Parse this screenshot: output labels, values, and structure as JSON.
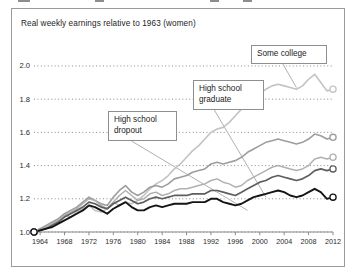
{
  "figure": {
    "title": "Real weekly earnings relative to 1963 (women)"
  },
  "chart_data": {
    "type": "line",
    "title": "Real weekly earnings relative to 1963 (women)",
    "xlabel": "",
    "ylabel": "",
    "xlim": [
      1963,
      2012
    ],
    "ylim": [
      1.0,
      2.06
    ],
    "grid": "horizontal-dotted",
    "legend": "annotated-callouts",
    "y_ticks": [
      "1.0",
      "1.2",
      "1.4",
      "1.6",
      "1.8",
      "2.0"
    ],
    "y_tick_values": [
      1.0,
      1.2,
      1.4,
      1.6,
      1.8,
      2.0
    ],
    "x_ticks": [
      "1964",
      "1968",
      "1972",
      "1976",
      "1980",
      "1984",
      "1988",
      "1992",
      "1996",
      "2000",
      "2004",
      "2008",
      "2012"
    ],
    "x_tick_values": [
      1964,
      1968,
      1972,
      1976,
      1980,
      1984,
      1988,
      1992,
      1996,
      2000,
      2004,
      2008,
      2012
    ],
    "x": [
      1963,
      1964,
      1965,
      1966,
      1967,
      1968,
      1969,
      1970,
      1971,
      1972,
      1973,
      1974,
      1975,
      1976,
      1977,
      1978,
      1979,
      1980,
      1981,
      1982,
      1983,
      1984,
      1985,
      1986,
      1987,
      1988,
      1989,
      1990,
      1991,
      1992,
      1993,
      1994,
      1995,
      1996,
      1997,
      1998,
      1999,
      2000,
      2001,
      2002,
      2003,
      2004,
      2005,
      2006,
      2007,
      2008,
      2009,
      2010,
      2011,
      2012
    ],
    "series": [
      {
        "name": "Bachelor's degree or higher",
        "color": "#c3c3c3",
        "width": 1.6,
        "marker_start": "open-circle",
        "marker_end": "open-circle",
        "values": [
          1.0,
          1.02,
          1.03,
          1.05,
          1.07,
          1.1,
          1.09,
          1.12,
          1.14,
          1.16,
          1.13,
          1.12,
          1.14,
          1.18,
          1.16,
          1.18,
          1.17,
          1.19,
          1.22,
          1.26,
          1.29,
          1.31,
          1.34,
          1.38,
          1.41,
          1.45,
          1.49,
          1.52,
          1.56,
          1.6,
          1.62,
          1.63,
          1.66,
          1.7,
          1.74,
          1.77,
          1.8,
          1.83,
          1.86,
          1.88,
          1.89,
          1.88,
          1.87,
          1.86,
          1.88,
          1.92,
          1.95,
          1.9,
          1.85,
          1.86
        ]
      },
      {
        "name": "Some college",
        "color": "#9d9d9d",
        "width": 1.6,
        "marker_start": "open-circle",
        "marker_end": "open-circle",
        "values": [
          1.0,
          1.02,
          1.04,
          1.06,
          1.08,
          1.11,
          1.13,
          1.15,
          1.18,
          1.21,
          1.19,
          1.17,
          1.16,
          1.21,
          1.25,
          1.28,
          1.24,
          1.22,
          1.24,
          1.27,
          1.28,
          1.27,
          1.29,
          1.32,
          1.33,
          1.34,
          1.36,
          1.37,
          1.38,
          1.41,
          1.42,
          1.41,
          1.42,
          1.43,
          1.45,
          1.48,
          1.5,
          1.52,
          1.54,
          1.55,
          1.56,
          1.55,
          1.54,
          1.53,
          1.54,
          1.56,
          1.59,
          1.58,
          1.56,
          1.57
        ]
      },
      {
        "name": "High school graduate",
        "color": "#b0b0b0",
        "width": 1.5,
        "marker_start": "open-circle",
        "marker_end": "open-circle",
        "values": [
          1.0,
          1.01,
          1.03,
          1.05,
          1.07,
          1.1,
          1.12,
          1.14,
          1.17,
          1.2,
          1.19,
          1.16,
          1.14,
          1.18,
          1.22,
          1.25,
          1.22,
          1.19,
          1.2,
          1.23,
          1.24,
          1.22,
          1.23,
          1.25,
          1.26,
          1.26,
          1.27,
          1.28,
          1.29,
          1.31,
          1.32,
          1.3,
          1.29,
          1.27,
          1.28,
          1.31,
          1.33,
          1.35,
          1.37,
          1.39,
          1.4,
          1.39,
          1.38,
          1.37,
          1.38,
          1.4,
          1.44,
          1.45,
          1.44,
          1.45
        ]
      },
      {
        "name": "High school dropout",
        "color": "#5e5e5e",
        "width": 1.7,
        "marker_start": "open-circle",
        "marker_end": "open-circle",
        "values": [
          1.0,
          1.01,
          1.02,
          1.04,
          1.06,
          1.09,
          1.11,
          1.13,
          1.15,
          1.18,
          1.17,
          1.15,
          1.14,
          1.17,
          1.19,
          1.21,
          1.19,
          1.17,
          1.18,
          1.2,
          1.21,
          1.2,
          1.21,
          1.22,
          1.22,
          1.22,
          1.23,
          1.23,
          1.23,
          1.25,
          1.25,
          1.24,
          1.23,
          1.22,
          1.24,
          1.26,
          1.28,
          1.3,
          1.31,
          1.33,
          1.34,
          1.33,
          1.32,
          1.31,
          1.32,
          1.34,
          1.37,
          1.38,
          1.37,
          1.38
        ]
      },
      {
        "name": "All women",
        "color": "#141414",
        "width": 1.9,
        "marker_start": "open-circle",
        "marker_end": "open-circle",
        "values": [
          1.0,
          1.01,
          1.02,
          1.03,
          1.05,
          1.07,
          1.09,
          1.11,
          1.13,
          1.16,
          1.15,
          1.13,
          1.11,
          1.14,
          1.16,
          1.18,
          1.15,
          1.13,
          1.13,
          1.15,
          1.16,
          1.15,
          1.16,
          1.17,
          1.17,
          1.17,
          1.18,
          1.18,
          1.18,
          1.2,
          1.2,
          1.18,
          1.17,
          1.16,
          1.17,
          1.19,
          1.21,
          1.22,
          1.23,
          1.24,
          1.25,
          1.24,
          1.22,
          1.21,
          1.22,
          1.24,
          1.26,
          1.24,
          1.2,
          1.21
        ]
      }
    ],
    "annotations": [
      {
        "label": "Some college",
        "target_x": 2006,
        "target_y": 1.87
      },
      {
        "label": "High school\ngraduate",
        "target_x": 2001,
        "target_y": 1.21
      },
      {
        "label": "High school\ndropout",
        "target_x": 1998,
        "target_y": 1.13
      }
    ]
  }
}
